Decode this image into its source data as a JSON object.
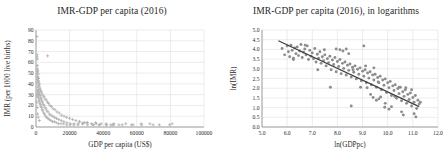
{
  "figure": {
    "background": "#ffffff",
    "marker_color_left": "#b3b3b3",
    "marker_color_right": "#8c8c8c",
    "trendline_color": "#3d3d3d",
    "axis_color": "#8d8d8d",
    "grid_color": "#dfdfdf"
  },
  "chart_data": [
    {
      "id": "imr-gdp-linear",
      "type": "scatter",
      "title": "IMR-GDP per capita (2016)",
      "xlabel": "GDP per capita (US$)",
      "ylabel": "IMR (per 1000 live births)",
      "xlim": [
        0,
        100000
      ],
      "ylim": [
        0,
        90
      ],
      "xticks": [
        0,
        20000,
        40000,
        60000,
        80000,
        100000
      ],
      "xticklabels": [
        "0",
        "20000",
        "40000",
        "60000",
        "80000",
        "100000"
      ],
      "yticks": [
        0,
        10,
        20,
        30,
        40,
        50,
        60,
        70,
        80,
        90
      ],
      "yticklabels": [
        "0",
        "10",
        "20",
        "30",
        "40",
        "50",
        "60",
        "70",
        "80",
        "90"
      ],
      "grid": true,
      "legend": "none",
      "marker": "plus",
      "points": [
        [
          480,
          84
        ],
        [
          640,
          67
        ],
        [
          700,
          65
        ],
        [
          780,
          63
        ],
        [
          820,
          57
        ],
        [
          900,
          54
        ],
        [
          760,
          52
        ],
        [
          1100,
          52
        ],
        [
          980,
          50
        ],
        [
          1250,
          49
        ],
        [
          6900,
          66
        ],
        [
          820,
          47
        ],
        [
          1180,
          46
        ],
        [
          1500,
          45
        ],
        [
          900,
          44
        ],
        [
          1350,
          43
        ],
        [
          1600,
          42
        ],
        [
          760,
          41
        ],
        [
          2100,
          40
        ],
        [
          1450,
          39
        ],
        [
          1900,
          38
        ],
        [
          1050,
          37
        ],
        [
          2400,
          36
        ],
        [
          1700,
          35
        ],
        [
          830,
          34
        ],
        [
          2650,
          34
        ],
        [
          1250,
          33
        ],
        [
          3100,
          33
        ],
        [
          1950,
          32
        ],
        [
          890,
          31
        ],
        [
          3600,
          31
        ],
        [
          2200,
          30
        ],
        [
          1400,
          30
        ],
        [
          4200,
          29
        ],
        [
          2500,
          29
        ],
        [
          1150,
          28
        ],
        [
          4800,
          28
        ],
        [
          2800,
          27
        ],
        [
          1600,
          27
        ],
        [
          5400,
          26
        ],
        [
          3200,
          26
        ],
        [
          1850,
          25
        ],
        [
          6100,
          25
        ],
        [
          3500,
          24
        ],
        [
          2050,
          24
        ],
        [
          6800,
          23
        ],
        [
          3900,
          23
        ],
        [
          2300,
          22
        ],
        [
          7500,
          22
        ],
        [
          4300,
          21
        ],
        [
          2600,
          21
        ],
        [
          8300,
          20
        ],
        [
          4800,
          20
        ],
        [
          2900,
          19
        ],
        [
          9200,
          19
        ],
        [
          5300,
          18
        ],
        [
          3300,
          18
        ],
        [
          10200,
          17
        ],
        [
          5900,
          17
        ],
        [
          3700,
          16
        ],
        [
          11300,
          16
        ],
        [
          6500,
          15
        ],
        [
          4100,
          15
        ],
        [
          12500,
          14
        ],
        [
          7200,
          14
        ],
        [
          4600,
          13
        ],
        [
          13800,
          13
        ],
        [
          8000,
          12
        ],
        [
          5100,
          12
        ],
        [
          15200,
          11
        ],
        [
          8900,
          11
        ],
        [
          5700,
          10
        ],
        [
          16700,
          10
        ],
        [
          9900,
          10
        ],
        [
          6400,
          9
        ],
        [
          18300,
          9
        ],
        [
          11000,
          9
        ],
        [
          7100,
          8
        ],
        [
          20000,
          8
        ],
        [
          12200,
          8
        ],
        [
          7900,
          7
        ],
        [
          21800,
          7
        ],
        [
          13500,
          7
        ],
        [
          8800,
          6
        ],
        [
          23700,
          6
        ],
        [
          15000,
          6
        ],
        [
          9800,
          5
        ],
        [
          25800,
          5
        ],
        [
          16600,
          5
        ],
        [
          10900,
          5
        ],
        [
          28000,
          4
        ],
        [
          18400,
          4
        ],
        [
          12100,
          4
        ],
        [
          30400,
          4
        ],
        [
          20400,
          3
        ],
        [
          13400,
          3
        ],
        [
          33000,
          3
        ],
        [
          22600,
          3
        ],
        [
          14900,
          3
        ],
        [
          35800,
          3
        ],
        [
          25000,
          3
        ],
        [
          16500,
          3
        ],
        [
          38800,
          3
        ],
        [
          27700,
          3
        ],
        [
          18300,
          2
        ],
        [
          42000,
          2
        ],
        [
          30700,
          2
        ],
        [
          20300,
          2
        ],
        [
          45500,
          2
        ],
        [
          34000,
          2
        ],
        [
          22500,
          2
        ],
        [
          49300,
          2
        ],
        [
          37700,
          2
        ],
        [
          25000,
          2
        ],
        [
          53400,
          3
        ],
        [
          41800,
          3
        ],
        [
          27700,
          3
        ],
        [
          57800,
          2
        ],
        [
          46300,
          2
        ],
        [
          30700,
          4
        ],
        [
          62600,
          3
        ],
        [
          51300,
          2
        ],
        [
          34000,
          2
        ],
        [
          67800,
          3
        ],
        [
          56800,
          2
        ],
        [
          37700,
          2
        ],
        [
          73400,
          2
        ],
        [
          62900,
          2
        ],
        [
          41800,
          2
        ],
        [
          79500,
          2
        ],
        [
          69700,
          2
        ],
        [
          46300,
          3
        ],
        [
          81000,
          3
        ],
        [
          44500,
          2
        ],
        [
          35500,
          4
        ],
        [
          29000,
          4
        ],
        [
          26000,
          5
        ],
        [
          2000,
          6
        ],
        [
          1300,
          9
        ],
        [
          950,
          12
        ],
        [
          700,
          18
        ],
        [
          600,
          23
        ],
        [
          550,
          29
        ]
      ]
    },
    {
      "id": "imr-gdp-log",
      "type": "scatter",
      "title": "IMR-GDP per capita (2016), in logarithms",
      "xlabel": "ln(GDPpc)",
      "ylabel": "ln(IMR)",
      "xlim": [
        5.0,
        12.0
      ],
      "ylim": [
        0.0,
        5.0
      ],
      "xticks": [
        5.0,
        6.0,
        7.0,
        8.0,
        9.0,
        10.0,
        11.0,
        12.0
      ],
      "xticklabels": [
        "5.0",
        "6.0",
        "7.0",
        "8.0",
        "9.0",
        "10.0",
        "11.0",
        "12.0"
      ],
      "yticks": [
        0.0,
        0.5,
        1.0,
        1.5,
        2.0,
        2.5,
        3.0,
        3.5,
        4.0,
        4.5,
        5.0
      ],
      "yticklabels": [
        "0.0",
        "0.5",
        "1.0",
        "1.5",
        "2.0",
        "2.5",
        "3.0",
        "3.5",
        "4.0",
        "4.5",
        "5.0"
      ],
      "grid": true,
      "legend": "none",
      "marker": "circle",
      "trendline": {
        "x0": 5.65,
        "y0": 4.45,
        "x1": 11.25,
        "y1": 1.05
      },
      "points": [
        [
          5.8,
          4.05
        ],
        [
          5.9,
          3.72
        ],
        [
          6.0,
          4.18
        ],
        [
          6.05,
          3.88
        ],
        [
          6.1,
          3.62
        ],
        [
          6.15,
          4.22
        ],
        [
          6.2,
          3.95
        ],
        [
          6.25,
          3.55
        ],
        [
          6.3,
          4.08
        ],
        [
          6.35,
          3.78
        ],
        [
          6.4,
          4.12
        ],
        [
          6.45,
          3.68
        ],
        [
          6.5,
          3.92
        ],
        [
          6.55,
          4.25
        ],
        [
          6.6,
          3.58
        ],
        [
          6.65,
          3.85
        ],
        [
          6.7,
          4.02
        ],
        [
          6.75,
          3.72
        ],
        [
          6.8,
          4.18
        ],
        [
          6.85,
          3.48
        ],
        [
          6.9,
          3.95
        ],
        [
          6.95,
          3.65
        ],
        [
          7.0,
          3.82
        ],
        [
          7.05,
          3.52
        ],
        [
          7.1,
          4.05
        ],
        [
          7.15,
          3.35
        ],
        [
          7.2,
          3.75
        ],
        [
          7.25,
          3.55
        ],
        [
          7.3,
          3.88
        ],
        [
          7.35,
          3.28
        ],
        [
          7.4,
          3.62
        ],
        [
          7.45,
          3.42
        ],
        [
          7.5,
          3.72
        ],
        [
          7.55,
          3.15
        ],
        [
          7.6,
          3.52
        ],
        [
          7.65,
          3.32
        ],
        [
          7.7,
          3.65
        ],
        [
          7.75,
          2.95
        ],
        [
          7.8,
          3.45
        ],
        [
          7.85,
          3.22
        ],
        [
          7.9,
          3.58
        ],
        [
          7.95,
          2.85
        ],
        [
          8.0,
          3.38
        ],
        [
          8.05,
          3.12
        ],
        [
          8.1,
          3.48
        ],
        [
          8.15,
          2.75
        ],
        [
          8.2,
          3.28
        ],
        [
          8.25,
          3.02
        ],
        [
          8.3,
          3.35
        ],
        [
          8.35,
          2.68
        ],
        [
          8.4,
          3.18
        ],
        [
          8.45,
          2.92
        ],
        [
          8.5,
          3.25
        ],
        [
          8.55,
          2.58
        ],
        [
          8.6,
          3.08
        ],
        [
          8.65,
          2.82
        ],
        [
          8.7,
          3.15
        ],
        [
          8.75,
          2.48
        ],
        [
          8.8,
          2.98
        ],
        [
          8.85,
          2.72
        ],
        [
          8.9,
          3.05
        ],
        [
          8.95,
          2.38
        ],
        [
          9.0,
          2.88
        ],
        [
          9.05,
          2.62
        ],
        [
          9.1,
          2.95
        ],
        [
          9.15,
          2.28
        ],
        [
          9.2,
          2.78
        ],
        [
          9.25,
          2.52
        ],
        [
          9.3,
          2.85
        ],
        [
          9.35,
          2.18
        ],
        [
          9.4,
          2.68
        ],
        [
          9.45,
          2.42
        ],
        [
          9.5,
          2.72
        ],
        [
          9.55,
          2.05
        ],
        [
          9.6,
          2.55
        ],
        [
          9.65,
          2.28
        ],
        [
          9.7,
          2.62
        ],
        [
          9.75,
          1.92
        ],
        [
          9.8,
          2.42
        ],
        [
          9.85,
          2.15
        ],
        [
          9.9,
          2.48
        ],
        [
          9.95,
          1.78
        ],
        [
          10.0,
          2.28
        ],
        [
          10.05,
          2.02
        ],
        [
          10.1,
          2.35
        ],
        [
          10.15,
          1.62
        ],
        [
          10.2,
          2.12
        ],
        [
          10.25,
          1.88
        ],
        [
          10.3,
          2.18
        ],
        [
          10.35,
          1.48
        ],
        [
          10.4,
          1.98
        ],
        [
          10.45,
          1.72
        ],
        [
          10.5,
          2.05
        ],
        [
          10.55,
          1.35
        ],
        [
          10.6,
          1.82
        ],
        [
          10.65,
          1.58
        ],
        [
          10.7,
          1.92
        ],
        [
          10.75,
          1.22
        ],
        [
          10.8,
          1.68
        ],
        [
          10.85,
          1.42
        ],
        [
          10.9,
          1.75
        ],
        [
          10.95,
          1.08
        ],
        [
          11.0,
          1.52
        ],
        [
          11.05,
          1.28
        ],
        [
          11.1,
          1.62
        ],
        [
          11.15,
          0.95
        ],
        [
          11.2,
          1.38
        ],
        [
          11.25,
          1.18
        ],
        [
          11.3,
          1.28
        ],
        [
          8.55,
          1.08
        ],
        [
          9.05,
          4.18
        ],
        [
          7.72,
          2.05
        ],
        [
          8.1,
          3.98
        ],
        [
          8.35,
          4.02
        ],
        [
          9.45,
          3.05
        ],
        [
          9.55,
          1.38
        ],
        [
          9.65,
          1.45
        ],
        [
          9.72,
          1.55
        ],
        [
          9.9,
          1.22
        ],
        [
          10.05,
          0.92
        ],
        [
          10.15,
          1.05
        ],
        [
          10.45,
          2.05
        ],
        [
          10.55,
          0.78
        ],
        [
          10.62,
          0.62
        ],
        [
          10.72,
          2.02
        ],
        [
          10.95,
          1.92
        ],
        [
          11.12,
          0.52
        ],
        [
          11.05,
          0.68
        ],
        [
          6.25,
          3.48
        ],
        [
          7.22,
          2.95
        ],
        [
          7.48,
          3.98
        ],
        [
          8.22,
          3.92
        ],
        [
          8.92,
          2.05
        ],
        [
          9.18,
          2.02
        ],
        [
          9.32,
          1.68
        ],
        [
          9.42,
          1.52
        ],
        [
          9.62,
          2.32
        ],
        [
          9.88,
          1.02
        ],
        [
          10.28,
          1.58
        ],
        [
          6.72,
          4.22
        ],
        [
          7.95,
          4.02
        ],
        [
          8.45,
          3.78
        ],
        [
          8.62,
          2.95
        ],
        [
          9.12,
          3.15
        ]
      ]
    }
  ]
}
